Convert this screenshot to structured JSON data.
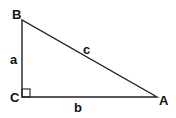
{
  "diagram": {
    "type": "right-triangle",
    "vertices": {
      "A": {
        "label": "A",
        "x": 157,
        "y": 97
      },
      "B": {
        "label": "B",
        "x": 22,
        "y": 20
      },
      "C": {
        "label": "C",
        "x": 22,
        "y": 97
      }
    },
    "sides": {
      "a": {
        "label": "a",
        "from": "B",
        "to": "C"
      },
      "b": {
        "label": "b",
        "from": "C",
        "to": "A"
      },
      "c": {
        "label": "c",
        "from": "B",
        "to": "A"
      }
    },
    "right_angle_at": "C",
    "stroke_color": "#222222",
    "label_color": "#111111"
  }
}
